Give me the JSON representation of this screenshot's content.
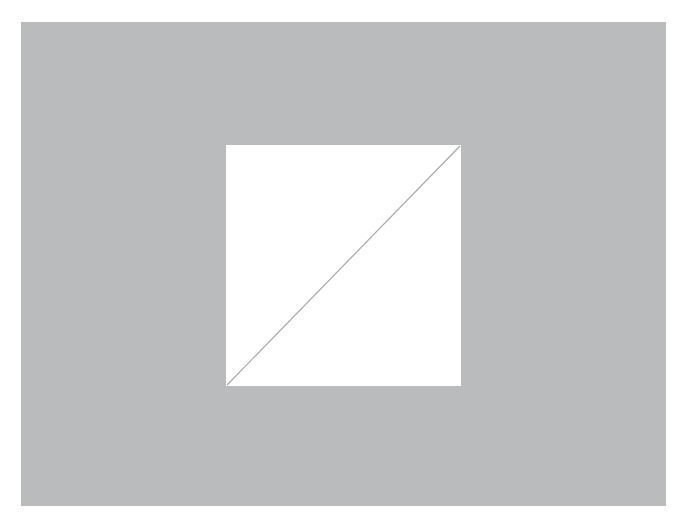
{
  "figure": {
    "background_color": "#b9bbbc",
    "square_color": "#ffffff",
    "diagonal": {
      "from": "bottom-left",
      "to": "top-right",
      "color": "#a8a8a8"
    }
  }
}
